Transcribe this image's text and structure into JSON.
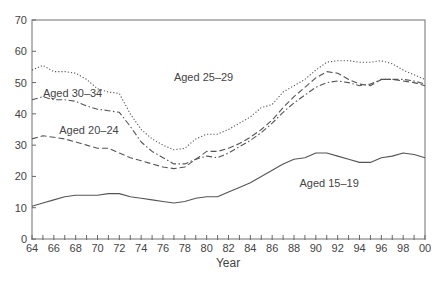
{
  "chart_data": {
    "type": "line",
    "title": "",
    "xlabel": "Year",
    "ylabel": "",
    "xlim": [
      64,
      100
    ],
    "ylim": [
      0,
      70
    ],
    "grid": false,
    "legend": "inline labels",
    "x_tick_labels": [
      "64",
      "66",
      "68",
      "70",
      "72",
      "74",
      "76",
      "78",
      "80",
      "82",
      "84",
      "86",
      "88",
      "90",
      "92",
      "94",
      "96",
      "98",
      "00"
    ],
    "y_tick_labels": [
      "0",
      "10",
      "20",
      "30",
      "40",
      "50",
      "60",
      "70"
    ],
    "x": [
      64,
      65,
      66,
      67,
      68,
      69,
      70,
      71,
      72,
      73,
      74,
      75,
      76,
      77,
      78,
      79,
      80,
      81,
      82,
      83,
      84,
      85,
      86,
      87,
      88,
      89,
      90,
      91,
      92,
      93,
      94,
      95,
      96,
      97,
      98,
      99,
      100
    ],
    "series": [
      {
        "name": "Aged 25–29",
        "style": "dotted",
        "label_pos": [
          77,
          50.5
        ],
        "values": [
          54,
          55.5,
          53.5,
          53.5,
          53,
          51,
          48,
          47,
          46.5,
          40,
          35,
          32,
          30,
          28.5,
          29,
          32,
          33.5,
          33.5,
          35,
          37,
          39,
          42,
          43,
          47,
          49,
          51,
          54,
          56.5,
          57,
          57,
          56.5,
          56.5,
          57,
          56,
          54,
          52.5,
          51
        ]
      },
      {
        "name": "Aged 30–34",
        "style": "dashdot",
        "label_pos": [
          65,
          45.5
        ],
        "values": [
          44.5,
          45.5,
          44.5,
          44.5,
          44,
          42.5,
          41.5,
          41,
          40.5,
          36,
          31,
          28,
          26,
          24,
          24,
          25.5,
          26.5,
          26,
          27.5,
          29.5,
          31.5,
          34,
          37,
          40.5,
          43.5,
          46,
          48.5,
          50,
          50.5,
          50,
          49,
          49.5,
          51,
          51,
          51,
          50.5,
          49.5
        ]
      },
      {
        "name": "Aged 20–24",
        "style": "dashed",
        "label_pos": [
          66.5,
          33.5
        ],
        "values": [
          32,
          33,
          32.5,
          32,
          31,
          30,
          29,
          29,
          27.5,
          26,
          25,
          24,
          23,
          22.5,
          23,
          25.5,
          28,
          28,
          29,
          30.5,
          32.5,
          35,
          38,
          42,
          45.5,
          48.5,
          51.5,
          53.5,
          53,
          51,
          49.5,
          49,
          51,
          51,
          50.5,
          50,
          49
        ]
      },
      {
        "name": "Aged 15–19",
        "style": "solid",
        "label_pos": [
          88.5,
          16.5
        ],
        "values": [
          10.5,
          11.5,
          12.5,
          13.5,
          14,
          14,
          14,
          14.5,
          14.5,
          13.5,
          13,
          12.5,
          12,
          11.5,
          12,
          13,
          13.5,
          13.5,
          15,
          16.5,
          18,
          20,
          22,
          24,
          25.5,
          26,
          27.5,
          27.5,
          26.5,
          25.5,
          24.5,
          24.5,
          26,
          26.5,
          27.5,
          27,
          26
        ]
      }
    ],
    "colors": {
      "line": "#555555",
      "axis": "#666666",
      "text": "#444444"
    }
  }
}
